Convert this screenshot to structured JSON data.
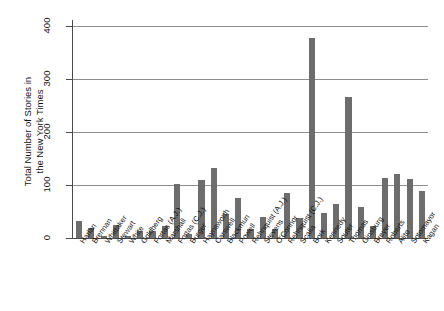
{
  "chart_data": {
    "type": "bar",
    "title": "",
    "xlabel": "",
    "ylabel": "Total Number of Stories in the New York Times",
    "ylabel_lines": [
      "Total Number of Stories in",
      "the New York Times"
    ],
    "ylim": [
      0,
      400
    ],
    "yticks": [
      0,
      100,
      200,
      300,
      400
    ],
    "ytick_labels": [
      "0",
      "100",
      "200",
      "300",
      "400"
    ],
    "grid": true,
    "grid_axis": "y",
    "legend": null,
    "bar_color": "#6d6d6d",
    "categories": [
      "Harlan",
      "Brennan",
      "Whittaker",
      "Stewart",
      "White",
      "Goldberg",
      "Fortas (A.J.)",
      "Marshall",
      "Fortas (C.J.)",
      "Burger",
      "Haynsworth",
      "Carswell",
      "Blackmun",
      "Powell",
      "Rehnquist (A.J.)",
      "Stevens",
      "O'Connor",
      "Rehnquist (C.J.)",
      "Scalia",
      "Bork",
      "Kennedy",
      "Souter",
      "Thomas",
      "Ginsburg",
      "Breyer",
      "Roberts",
      "Alito",
      "Sotomayor",
      "Kagan"
    ],
    "values": [
      33,
      19,
      4,
      24,
      4,
      13,
      13,
      22,
      101,
      8,
      110,
      133,
      45,
      75,
      17,
      40,
      17,
      84,
      38,
      377,
      48,
      65,
      266,
      58,
      22,
      113,
      121,
      112,
      88
    ]
  }
}
